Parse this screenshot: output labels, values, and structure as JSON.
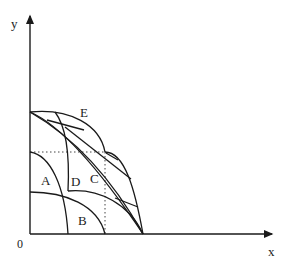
{
  "axes": {
    "x_label": "x",
    "y_label": "y",
    "origin_label": "0"
  },
  "regions": {
    "A": "A",
    "B": "B",
    "C": "C",
    "D": "D",
    "E": "E"
  },
  "colors": {
    "line": "#1a1a1a",
    "dotted": "#444444",
    "background": "#ffffff"
  }
}
